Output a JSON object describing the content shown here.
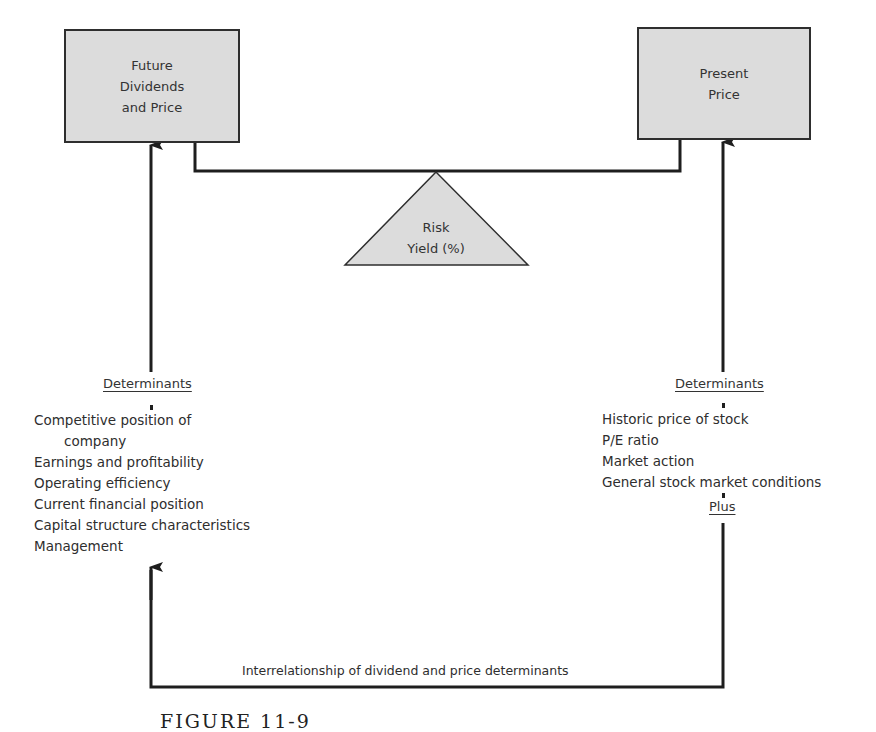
{
  "diagram": {
    "left_box": {
      "label": "Future\nDividends\nand Price"
    },
    "right_box": {
      "label": "Present\nPrice"
    },
    "fulcrum": {
      "label": "Risk\nYield (%)"
    },
    "left_determinants": {
      "heading": "Determinants",
      "items": [
        "Competitive position of",
        "company",
        "Earnings and profitability",
        "Operating efficiency",
        "Current financial position",
        "Capital structure characteristics",
        "Management"
      ]
    },
    "right_determinants": {
      "heading": "Determinants",
      "items": [
        "Historic price of stock",
        "P/E ratio",
        "Market action",
        "General stock market conditions"
      ],
      "footer": "Plus"
    },
    "bottom_connector": {
      "label": "Interrelationship of dividend and price determinants"
    },
    "caption": "FIGURE 11-9"
  },
  "colors": {
    "box_fill": "#dcdcdc",
    "line": "#1e1e1e",
    "text": "#2e2e2e"
  }
}
